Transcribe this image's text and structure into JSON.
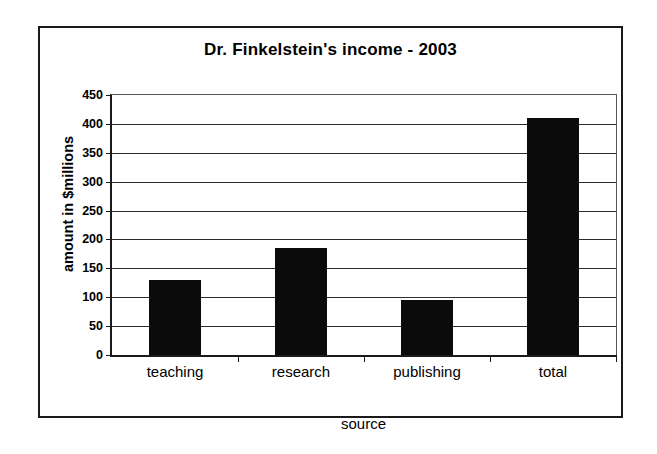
{
  "chart_data": {
    "type": "bar",
    "title": "Dr. Finkelstein's income - 2003",
    "xlabel": "source",
    "ylabel": "amount in $millions",
    "categories": [
      "teaching",
      "research",
      "publishing",
      "total"
    ],
    "values": [
      130,
      185,
      95,
      410
    ],
    "ylim": [
      0,
      450
    ],
    "ytick_labels": [
      "450",
      "400",
      "350",
      "300",
      "250",
      "200",
      "150",
      "100",
      "50",
      "0"
    ],
    "ytick_values": [
      450,
      400,
      350,
      300,
      250,
      200,
      150,
      100,
      50,
      0
    ],
    "ytick_step": 50,
    "grid": true,
    "legend": false,
    "bar_color": "#0b0b0b",
    "axis_color": "#1a1a1a",
    "background": "#ffffff"
  }
}
